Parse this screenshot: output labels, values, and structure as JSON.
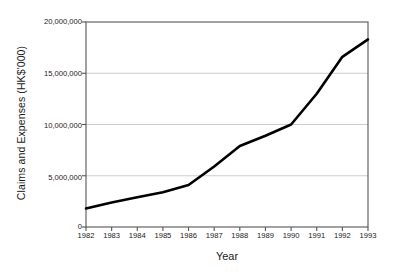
{
  "chart_data": {
    "type": "line",
    "title": "",
    "xlabel": "Year",
    "ylabel": "Claims and Expenses (HK$'000)",
    "categories": [
      "1982",
      "1983",
      "1984",
      "1985",
      "1986",
      "1987",
      "1988",
      "1989",
      "1990",
      "1991",
      "1992",
      "1993"
    ],
    "x": [
      1982,
      1983,
      1984,
      1985,
      1986,
      1987,
      1988,
      1989,
      1990,
      1991,
      1992,
      1993
    ],
    "values": [
      1800000,
      2400000,
      2900000,
      3400000,
      4100000,
      5900000,
      7900000,
      8900000,
      10000000,
      13000000,
      16600000,
      18300000
    ],
    "series": [
      {
        "name": "Claims and Expenses",
        "values": [
          1800000,
          2400000,
          2900000,
          3400000,
          4100000,
          5900000,
          7900000,
          8900000,
          10000000,
          13000000,
          16600000,
          18300000
        ]
      }
    ],
    "ylim": [
      0,
      20000000
    ],
    "xlim": [
      1982,
      1993
    ],
    "yticks": [
      0,
      5000000,
      10000000,
      15000000,
      20000000
    ],
    "ytick_labels": [
      "0",
      "5,000,000",
      "10,000,000",
      "15,000,000",
      "20,000,000"
    ],
    "xtick_labels": [
      "1982",
      "1983",
      "1984",
      "1985",
      "1986",
      "1987",
      "1988",
      "1989",
      "1990",
      "1991",
      "1992",
      "1993"
    ],
    "grid": "horizontal",
    "legend": "none",
    "line_color": "#000000",
    "grid_color": "#cccccc",
    "axis_color": "#555555",
    "background": "#ffffff"
  }
}
